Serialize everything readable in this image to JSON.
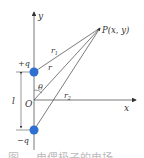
{
  "figure": {
    "axes": {
      "x_label": "x",
      "y_label": "y",
      "origin_label": "O"
    },
    "charges": [
      {
        "label": "+q",
        "color": "#2f6fd1"
      },
      {
        "label": "−q",
        "color": "#2f6fd1"
      }
    ],
    "point": {
      "label": "P(x, y)"
    },
    "distances": {
      "r1": "r",
      "r1_sub": "1",
      "r": "r",
      "r2": "r",
      "r2_sub": "2"
    },
    "angle": "θ",
    "separation": "l",
    "caption": "图 ... 电偶极子的电场"
  }
}
